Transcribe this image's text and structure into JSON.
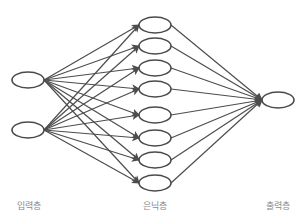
{
  "diagram": {
    "type": "neural-network",
    "colors": {
      "node_stroke": "#4a4a4a",
      "edge": "#4d4d4d",
      "label": "#8a8a8a",
      "background": "#ffffff"
    },
    "layers": [
      {
        "id": "input",
        "label": "입력층",
        "label_x": 29,
        "node_x": 28,
        "nodes_y": [
          80,
          130
        ]
      },
      {
        "id": "hidden",
        "label": "은닉층",
        "label_x": 155,
        "node_x": 155,
        "nodes_y": [
          25,
          46,
          68,
          89,
          115,
          138,
          160,
          183
        ]
      },
      {
        "id": "output",
        "label": "출력층",
        "label_x": 278,
        "node_x": 278,
        "nodes_y": [
          100
        ]
      }
    ],
    "node_rx": 16,
    "node_ry": 8,
    "connections": "fully-connected-with-arrows"
  }
}
